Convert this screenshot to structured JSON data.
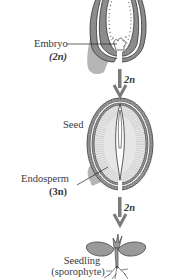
{
  "diagram": {
    "stages": [
      {
        "id": "ovule",
        "labels": [
          {
            "text": "Embryo"
          },
          {
            "text": "(2n)"
          }
        ]
      },
      {
        "id": "seed",
        "title": "Seed",
        "labels": [
          {
            "text": "Endosperm"
          },
          {
            "text": "(3n)"
          }
        ]
      },
      {
        "id": "seedling",
        "labels": [
          {
            "text": "Seedling"
          },
          {
            "text": "(sporophyte)"
          }
        ]
      }
    ],
    "arrows": [
      {
        "label": "2n"
      },
      {
        "label": "2n"
      }
    ],
    "colors": {
      "tissue_gray": "#8a8a8a",
      "light_gray": "#c8c8c8",
      "line": "#333333",
      "background": "#ffffff"
    }
  }
}
